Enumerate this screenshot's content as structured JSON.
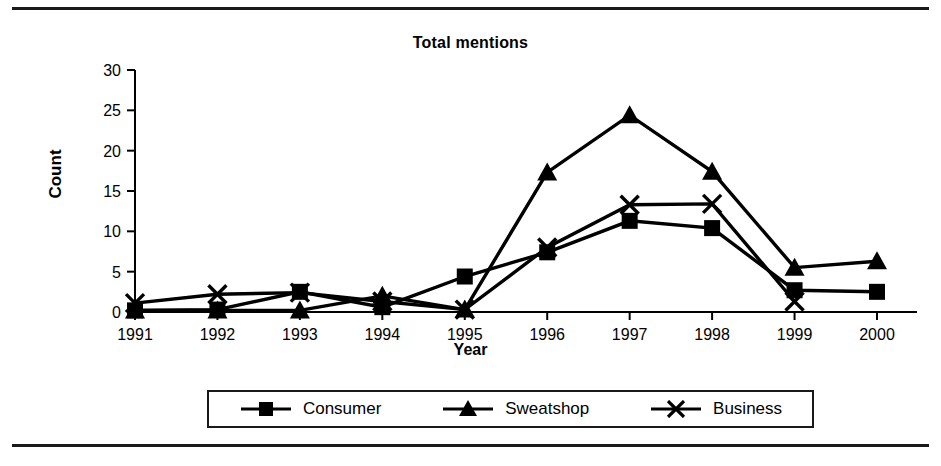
{
  "page": {
    "has_top_rule": true,
    "has_bottom_rule": true,
    "background_color": "#ffffff",
    "ink_color": "#000000"
  },
  "chart_data": {
    "type": "line",
    "title": "Total mentions",
    "xlabel": "Year",
    "ylabel": "Count",
    "categories": [
      "1991",
      "1992",
      "1993",
      "1994",
      "1995",
      "1996",
      "1997",
      "1998",
      "1999",
      "2000"
    ],
    "x": [
      1991,
      1992,
      1993,
      1994,
      1995,
      1996,
      1997,
      1998,
      1999,
      2000
    ],
    "series": [
      {
        "name": "Consumer",
        "marker": "square",
        "values": [
          0.2,
          0.3,
          2.5,
          0.6,
          4.4,
          7.4,
          11.3,
          10.4,
          2.7,
          2.5
        ]
      },
      {
        "name": "Sweatshop",
        "marker": "triangle",
        "values": [
          0.2,
          0.2,
          0.2,
          2.0,
          0.3,
          17.3,
          24.4,
          17.4,
          5.5,
          6.3
        ]
      },
      {
        "name": "Business",
        "marker": "cross-x",
        "values": [
          1.1,
          2.2,
          2.4,
          1.3,
          0.3,
          8.0,
          13.3,
          13.4,
          1.3,
          null
        ]
      }
    ],
    "ylim": [
      0,
      30
    ],
    "yticks": [
      0,
      5,
      10,
      15,
      20,
      25,
      30
    ],
    "xlim": [
      1991,
      2000
    ],
    "grid": false,
    "legend_position": "bottom",
    "legend_entries": [
      "Consumer",
      "Sweatshop",
      "Business"
    ],
    "line_color": "#000000",
    "annotations": []
  }
}
